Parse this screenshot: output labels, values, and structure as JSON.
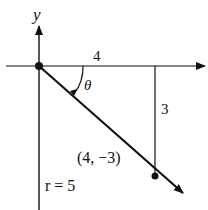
{
  "diagram": {
    "axis_y_label": "y",
    "horizontal_leg_label": "4",
    "vertical_leg_label": "3",
    "angle_label": "θ",
    "point_label": "(4, −3)",
    "radius_label": "r = 5"
  },
  "colors": {
    "ink": "#111111",
    "background": "#ffffff"
  }
}
